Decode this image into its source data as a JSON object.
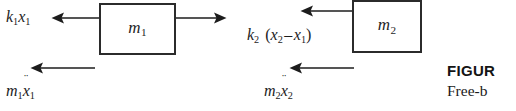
{
  "figure": {
    "type": "free-body-diagram",
    "bodies": [
      {
        "id": "mass-1",
        "label": "m",
        "label_sub": "1",
        "label_full": "m1"
      },
      {
        "id": "mass-2",
        "label": "m",
        "label_sub": "2",
        "label_full": "m2"
      }
    ],
    "force_labels": [
      {
        "id": "spring-force-1",
        "text": "k1x1",
        "base": "k",
        "base_sub": "1",
        "var": "x",
        "var_sub": "1",
        "direction": "left"
      },
      {
        "id": "inertia-force-1",
        "text": "m1ẍ1",
        "base": "m",
        "base_sub": "1",
        "var": "x",
        "var_accent": "¨",
        "var_sub": "1",
        "direction": "left"
      },
      {
        "id": "spring-force-2",
        "text": "k2 (x2 − x1)",
        "base": "k",
        "base_sub": "2",
        "open_paren": "(",
        "term1": "x",
        "term1_sub": "2",
        "operator": "–",
        "term2": "x",
        "term2_sub": "1",
        "close_paren": ")",
        "direction": "left"
      },
      {
        "id": "inertia-force-2",
        "text": "m2ẍ2",
        "base": "m",
        "base_sub": "2",
        "var": "x",
        "var_accent": "¨",
        "var_sub": "2",
        "direction": "left"
      }
    ],
    "arrows": [
      {
        "id": "arrow-mass1-left",
        "direction": "left",
        "attached_to": "mass-1"
      },
      {
        "id": "arrow-mass1-right",
        "direction": "right",
        "attached_to": "mass-1"
      },
      {
        "id": "arrow-mass1-inertia",
        "direction": "left",
        "attached_to": "inertia-force-1"
      },
      {
        "id": "arrow-mass2-left",
        "direction": "left",
        "attached_to": "mass-2"
      },
      {
        "id": "arrow-mass2-inertia",
        "direction": "left",
        "attached_to": "inertia-force-2"
      }
    ]
  },
  "caption": {
    "title": "FIGUR",
    "body": "Free-b"
  },
  "colors": {
    "ink": "#1c1c1c",
    "box_stroke": "#2b2b2b",
    "background": "#ffffff"
  }
}
